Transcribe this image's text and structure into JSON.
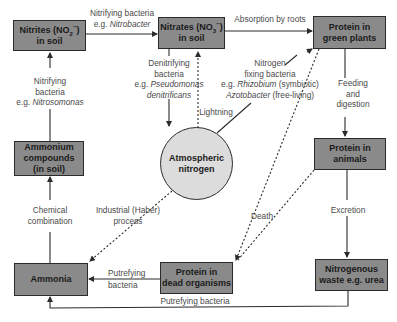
{
  "colors": {
    "box_fill": "#8a8a8a",
    "circle_fill": "#dcdcdc",
    "line": "#2b2b2b",
    "text": "#4a4a4a"
  },
  "nodes": {
    "nitrites": {
      "line1": "Nitrites (NO",
      "sub": "2",
      "sup": "−",
      "close": ")",
      "line2": "in soil"
    },
    "nitrates": {
      "line1": "Nitrates (NO",
      "sub": "3",
      "sup": "−",
      "close": ")",
      "line2": "in soil"
    },
    "protein_plants": {
      "line1": "Protein in",
      "line2": "green plants"
    },
    "ammonium": {
      "line1": "Ammonium",
      "line2": "compounds",
      "line3": "(in soil)"
    },
    "atmospheric_nitrogen": {
      "line1": "Atmospheric",
      "line2": "nitrogen"
    },
    "protein_animals": {
      "line1": "Protein in",
      "line2": "animals"
    },
    "ammonia": {
      "line1": "Ammonia"
    },
    "protein_dead": {
      "line1": "Protein in",
      "line2": "dead organisms"
    },
    "nitrogenous_waste": {
      "line1": "Nitrogenous",
      "line2": "waste e.g. urea"
    }
  },
  "edges": {
    "nitrifying_nitrobacter": {
      "line1": "Nitrifying bacteria",
      "eg": "e.g. ",
      "species": "Nitrobacter"
    },
    "absorption": {
      "line1": "Absorption by roots"
    },
    "nitrifying_nitrosomonas": {
      "line1": "Nitrifying",
      "line2": "bacteria",
      "eg": "e.g. ",
      "species": "Nitrosomonas"
    },
    "denitrifying": {
      "line1": "Denitrifying",
      "line2": "bacteria",
      "eg": "e.g. ",
      "species1": "Pseudomonas",
      "species2": "denitrificans"
    },
    "lightning": {
      "line1": "Lightning"
    },
    "nitrogen_fixing": {
      "line1": "Nitrogen",
      "line2": "fixing bacteria",
      "eg": "e.g. ",
      "species1": "Rhizobium",
      "note1": " (symbiotic)",
      "species2": "Azotobacter",
      "note2": " (free-living)"
    },
    "feeding": {
      "line1": "Feeding",
      "line2": "and",
      "line3": "digestion"
    },
    "chemical": {
      "line1": "Chemical",
      "line2": "combination"
    },
    "industrial": {
      "line1": "Industrial (Haber)",
      "line2": "process"
    },
    "death": {
      "line1": "Death"
    },
    "excretion": {
      "line1": "Excretion"
    },
    "putrefying_top": {
      "line1": "Putrefying",
      "line2": "bacteria"
    },
    "putrefying_bottom": {
      "line1": "Putrefying bacteria"
    }
  }
}
